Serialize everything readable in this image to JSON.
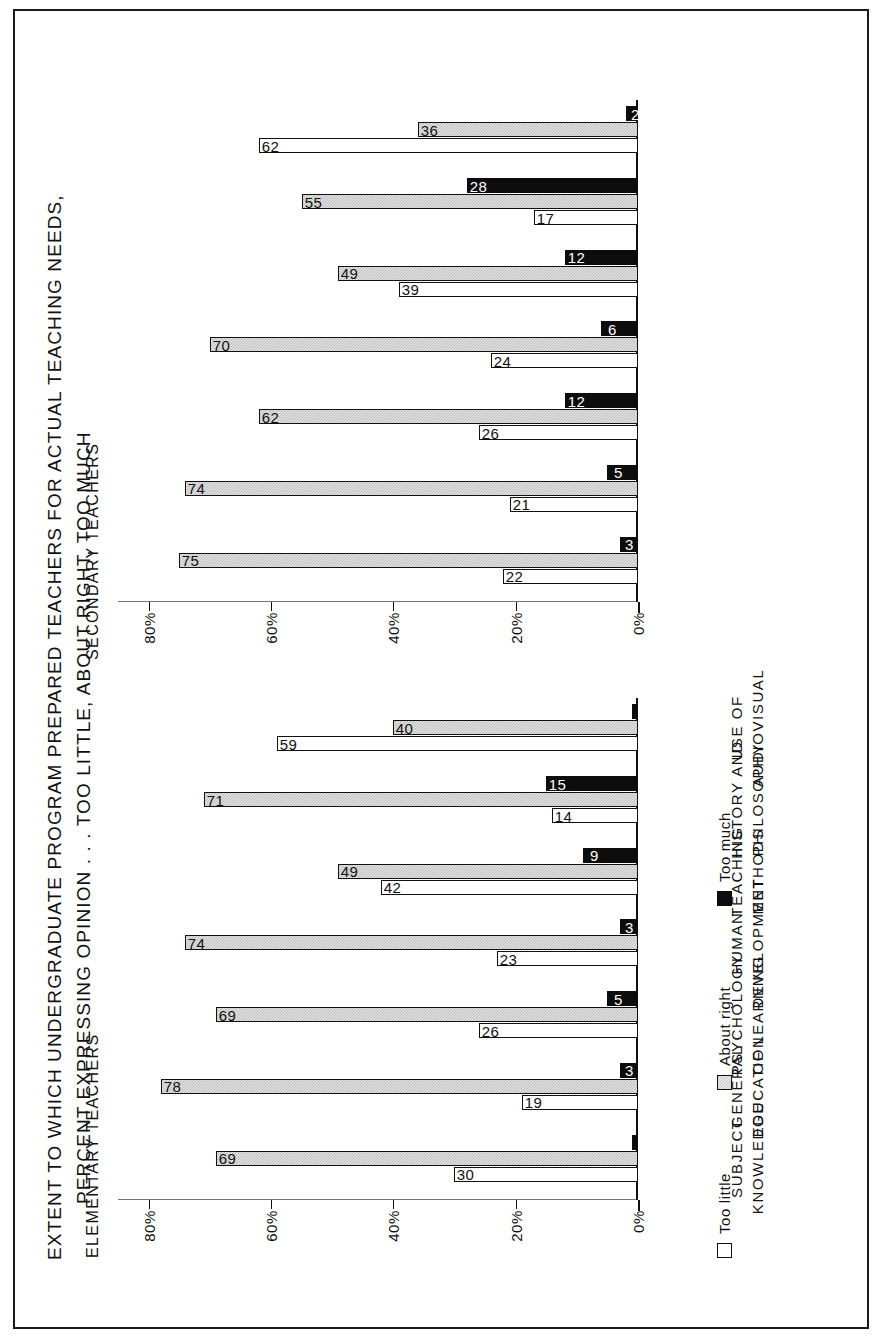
{
  "chart_data": {
    "type": "bar",
    "title": "EXTENT TO WHICH UNDERGRADUATE PROGRAM PREPARED TEACHERS FOR ACTUAL TEACHING NEEDS, PERCENT EXPRESSING OPINION . . . TOO LITTLE, ABOUT RIGHT, TOO MUCH",
    "title_line1": "EXTENT TO WHICH UNDERGRADUATE PROGRAM PREPARED TEACHERS FOR ACTUAL TEACHING NEEDS,",
    "title_line2": "PERCENT EXPRESSING OPINION . . . TOO LITTLE, ABOUT RIGHT, TOO MUCH",
    "orientation": "vertical-bars-rotated-90",
    "categories": [
      "SUBJECT\nKNOWLEDGE",
      "GENERAL\nEDUCATION",
      "PSYCHOLOGY\nOF LEARNING",
      "HUMAN\nDEVELOPMENT",
      "TEACHING\nMETHODS",
      "HISTORY AND\nPHILOSOPHY",
      "USE OF\nAUDIOVISUAL"
    ],
    "ylabel": "",
    "xlabel": "",
    "ylim": [
      0,
      85
    ],
    "yticks": [
      0,
      20,
      40,
      60,
      80
    ],
    "ytick_labels": [
      "0%",
      "20%",
      "40%",
      "60%",
      "80%"
    ],
    "grid": false,
    "legend_position": "bottom-right",
    "legend": [
      {
        "label": "Too little",
        "key": "too_little",
        "color": "#ffffff"
      },
      {
        "label": "About right",
        "key": "about_right",
        "color": "#c9c9c9"
      },
      {
        "label": "Too much",
        "key": "too_much",
        "color": "#0d0d0d"
      }
    ],
    "panels": [
      {
        "name": "elementary",
        "label": "ELEMENTARY TEACHERS",
        "series": [
          {
            "name": "Too little",
            "values": [
              30,
              19,
              26,
              23,
              42,
              14,
              59
            ]
          },
          {
            "name": "About right",
            "values": [
              69,
              78,
              69,
              74,
              49,
              71,
              40
            ]
          },
          {
            "name": "Too much",
            "values": [
              1,
              3,
              5,
              3,
              9,
              15,
              1
            ]
          }
        ]
      },
      {
        "name": "secondary",
        "label": "SECONDARY TEACHERS",
        "series": [
          {
            "name": "Too little",
            "values": [
              22,
              21,
              26,
              24,
              39,
              17,
              62
            ]
          },
          {
            "name": "About right",
            "values": [
              75,
              74,
              62,
              70,
              49,
              55,
              36
            ]
          },
          {
            "name": "Too much",
            "values": [
              3,
              5,
              12,
              6,
              12,
              28,
              2
            ]
          }
        ]
      }
    ]
  }
}
